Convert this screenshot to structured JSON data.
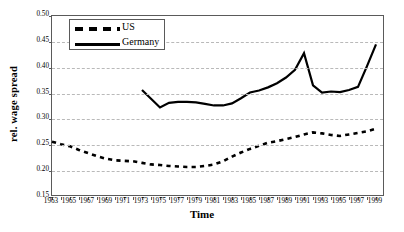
{
  "chart_data": {
    "type": "line",
    "title": "",
    "xlabel": "Time",
    "ylabel": "rel. wage spread",
    "xlim": [
      1963,
      2000
    ],
    "ylim": [
      0.15,
      0.5
    ],
    "ytick_labels": [
      "0.50",
      "0.45",
      "0.40",
      "0.35",
      "0.30",
      "0.25",
      "0.20",
      "0.15"
    ],
    "ytick_values": [
      0.5,
      0.45,
      0.4,
      0.35,
      0.3,
      0.25,
      0.2,
      0.15
    ],
    "xtick_labels": [
      "1963",
      "1965",
      "1967",
      "1969",
      "1971",
      "1973",
      "1975",
      "1977",
      "1979",
      "1981",
      "1983",
      "1985",
      "1987",
      "1989",
      "1991",
      "1993",
      "1995",
      "1997",
      "1999"
    ],
    "xtick_values": [
      1963,
      1965,
      1967,
      1969,
      1971,
      1973,
      1975,
      1977,
      1979,
      1981,
      1983,
      1985,
      1987,
      1989,
      1991,
      1993,
      1995,
      1997,
      1999
    ],
    "grid": "horizontal-dashed",
    "legend_position": "top-left",
    "series": [
      {
        "name": "US",
        "style": "dashed",
        "color": "#000000",
        "x": [
          1963,
          1964,
          1965,
          1966,
          1967,
          1968,
          1969,
          1970,
          1971,
          1972,
          1973,
          1974,
          1975,
          1976,
          1977,
          1978,
          1979,
          1980,
          1981,
          1982,
          1983,
          1984,
          1985,
          1986,
          1987,
          1988,
          1989,
          1990,
          1991,
          1992,
          1993,
          1994,
          1995,
          1996,
          1997,
          1998,
          1999
        ],
        "values": [
          0.257,
          0.252,
          0.248,
          0.241,
          0.235,
          0.229,
          0.224,
          0.221,
          0.22,
          0.219,
          0.216,
          0.213,
          0.212,
          0.21,
          0.209,
          0.208,
          0.208,
          0.21,
          0.213,
          0.219,
          0.228,
          0.236,
          0.243,
          0.249,
          0.255,
          0.258,
          0.262,
          0.266,
          0.271,
          0.275,
          0.273,
          0.27,
          0.268,
          0.271,
          0.274,
          0.277,
          0.282
        ]
      },
      {
        "name": "Germany",
        "style": "solid",
        "color": "#000000",
        "x": [
          1973,
          1974,
          1975,
          1976,
          1977,
          1978,
          1979,
          1980,
          1981,
          1982,
          1983,
          1984,
          1985,
          1986,
          1987,
          1988,
          1989,
          1990,
          1991,
          1992,
          1993,
          1994,
          1995,
          1996,
          1997,
          1998,
          1999
        ],
        "values": [
          0.357,
          0.34,
          0.323,
          0.332,
          0.334,
          0.334,
          0.333,
          0.33,
          0.327,
          0.327,
          0.331,
          0.341,
          0.352,
          0.356,
          0.362,
          0.37,
          0.381,
          0.396,
          0.428,
          0.366,
          0.352,
          0.354,
          0.353,
          0.357,
          0.363,
          0.403,
          0.445
        ]
      }
    ]
  },
  "legend": {
    "items": [
      {
        "label": "US",
        "style": "dashed"
      },
      {
        "label": "Germany",
        "style": "solid"
      }
    ]
  }
}
